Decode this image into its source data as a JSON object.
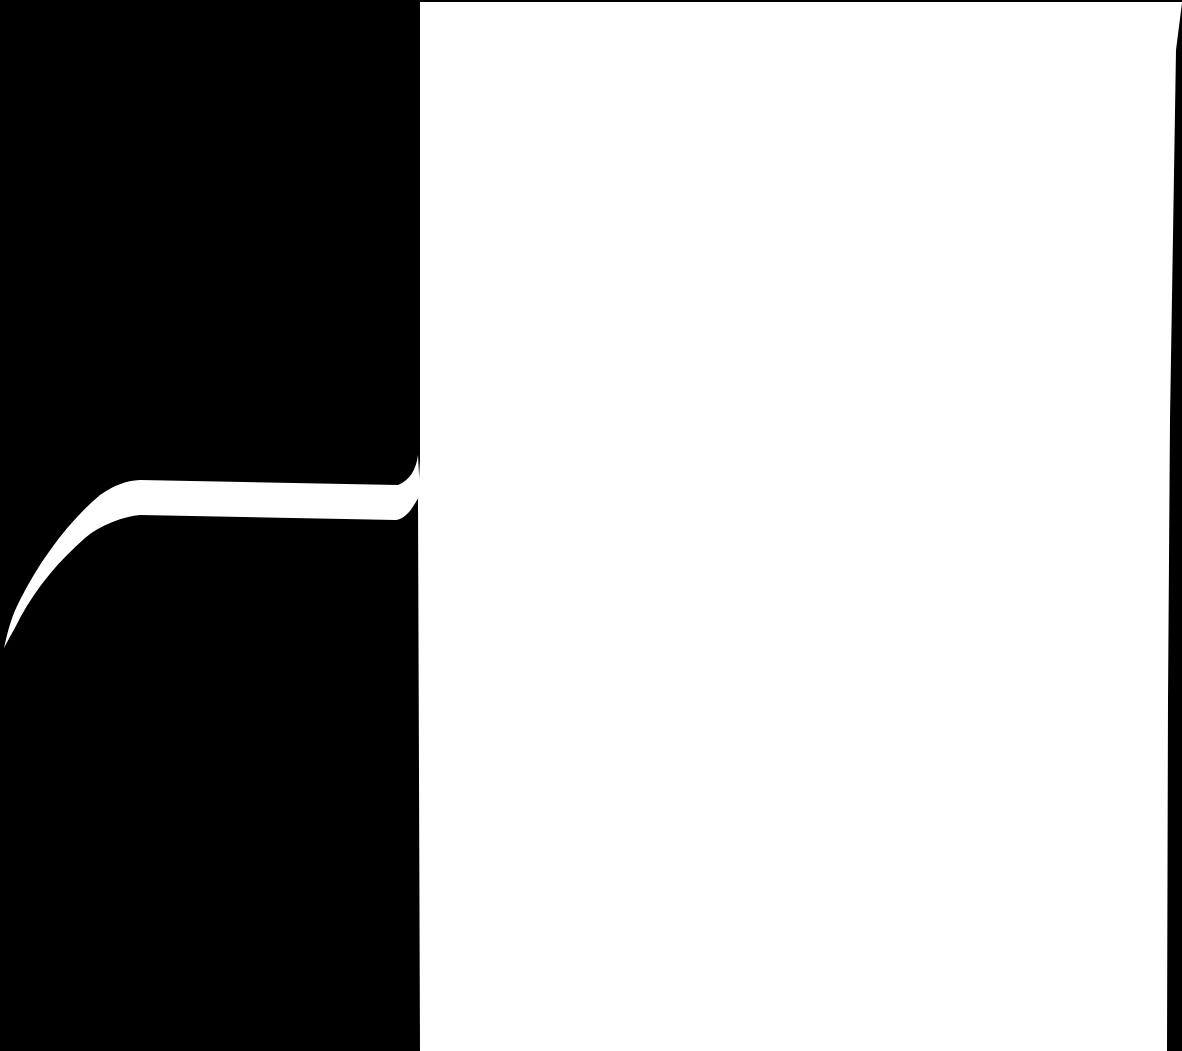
{
  "canvas": {
    "width": 1182,
    "height": 1051
  },
  "colors": {
    "background": "#000000",
    "foreground": "#ffffff"
  },
  "shapes": [
    {
      "name": "white-panel",
      "description": "large white rectangular region on the right"
    },
    {
      "name": "curved-strip",
      "description": "white curved band sweeping from lower-left into the panel"
    }
  ]
}
